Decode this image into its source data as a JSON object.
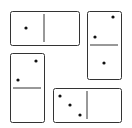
{
  "colors": {
    "stroke": "#333333",
    "pip": "#111111",
    "face": "#ffffff"
  },
  "dominoes": [
    {
      "id": "domino-1",
      "orientation": "horizontal",
      "x": 10,
      "y": 11,
      "w": 69,
      "h": 34,
      "divider": {
        "x1": 44,
        "y1": 14,
        "x2": 44,
        "y2": 42
      },
      "values": [
        1,
        0
      ],
      "pips": [
        [
          26,
          28
        ]
      ]
    },
    {
      "id": "domino-2",
      "orientation": "vertical",
      "x": 87,
      "y": 11,
      "w": 34,
      "h": 68,
      "divider": {
        "x1": 90,
        "y1": 45,
        "x2": 118,
        "y2": 45
      },
      "values": [
        2,
        1
      ],
      "pips": [
        [
          113,
          17
        ],
        [
          95,
          37
        ],
        [
          104,
          63
        ]
      ]
    },
    {
      "id": "domino-3",
      "orientation": "vertical",
      "x": 10,
      "y": 53,
      "w": 34,
      "h": 69,
      "divider": {
        "x1": 13,
        "y1": 88,
        "x2": 41,
        "y2": 88
      },
      "values": [
        2,
        0
      ],
      "pips": [
        [
          36,
          61
        ],
        [
          18,
          80
        ]
      ]
    },
    {
      "id": "domino-4",
      "orientation": "horizontal",
      "x": 53,
      "y": 88,
      "w": 68,
      "h": 34,
      "divider": {
        "x1": 87,
        "y1": 91,
        "x2": 87,
        "y2": 119
      },
      "values": [
        3,
        0
      ],
      "pips": [
        [
          60,
          96
        ],
        [
          70,
          105
        ],
        [
          80,
          115
        ]
      ]
    }
  ]
}
